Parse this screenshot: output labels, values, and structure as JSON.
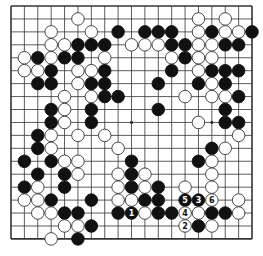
{
  "board": {
    "size": 19,
    "origin": {
      "x": 11,
      "y": 6
    },
    "spacing": {
      "x": 13.39,
      "y": 12.94
    },
    "line_color": "#333333",
    "star_points": [
      [
        3,
        3
      ],
      [
        3,
        9
      ],
      [
        3,
        15
      ],
      [
        9,
        3
      ],
      [
        9,
        9
      ],
      [
        9,
        15
      ],
      [
        15,
        3
      ],
      [
        15,
        9
      ],
      [
        15,
        15
      ]
    ],
    "colors": {
      "black": "#111111",
      "white": "#ffffff",
      "white_stroke": "#333333"
    },
    "stones": [
      {
        "c": 5,
        "r": 1,
        "color": "white"
      },
      {
        "c": 14,
        "r": 1,
        "color": "white"
      },
      {
        "c": 16,
        "r": 1,
        "color": "white"
      },
      {
        "c": 3,
        "r": 2,
        "color": "white"
      },
      {
        "c": 6,
        "r": 2,
        "color": "white"
      },
      {
        "c": 8,
        "r": 2,
        "color": "black"
      },
      {
        "c": 10,
        "r": 2,
        "color": "black"
      },
      {
        "c": 11,
        "r": 2,
        "color": "black"
      },
      {
        "c": 12,
        "r": 2,
        "color": "black"
      },
      {
        "c": 14,
        "r": 2,
        "color": "white"
      },
      {
        "c": 15,
        "r": 2,
        "color": "black"
      },
      {
        "c": 16,
        "r": 2,
        "color": "white"
      },
      {
        "c": 17,
        "r": 2,
        "color": "white"
      },
      {
        "c": 18,
        "r": 2,
        "color": "black"
      },
      {
        "c": 3,
        "r": 3,
        "color": "white"
      },
      {
        "c": 4,
        "r": 3,
        "color": "white"
      },
      {
        "c": 5,
        "r": 3,
        "color": "black"
      },
      {
        "c": 6,
        "r": 3,
        "color": "black"
      },
      {
        "c": 7,
        "r": 3,
        "color": "black"
      },
      {
        "c": 9,
        "r": 3,
        "color": "white"
      },
      {
        "c": 10,
        "r": 3,
        "color": "white"
      },
      {
        "c": 11,
        "r": 3,
        "color": "white"
      },
      {
        "c": 12,
        "r": 3,
        "color": "black"
      },
      {
        "c": 13,
        "r": 3,
        "color": "black"
      },
      {
        "c": 14,
        "r": 3,
        "color": "white"
      },
      {
        "c": 15,
        "r": 3,
        "color": "white"
      },
      {
        "c": 16,
        "r": 3,
        "color": "black"
      },
      {
        "c": 17,
        "r": 3,
        "color": "black"
      },
      {
        "c": 1,
        "r": 4,
        "color": "white"
      },
      {
        "c": 2,
        "r": 4,
        "color": "black"
      },
      {
        "c": 3,
        "r": 4,
        "color": "white"
      },
      {
        "c": 4,
        "r": 4,
        "color": "black"
      },
      {
        "c": 5,
        "r": 4,
        "color": "black"
      },
      {
        "c": 7,
        "r": 4,
        "color": "white"
      },
      {
        "c": 12,
        "r": 4,
        "color": "white"
      },
      {
        "c": 13,
        "r": 4,
        "color": "black"
      },
      {
        "c": 14,
        "r": 4,
        "color": "white"
      },
      {
        "c": 15,
        "r": 4,
        "color": "white"
      },
      {
        "c": 1,
        "r": 5,
        "color": "white"
      },
      {
        "c": 2,
        "r": 5,
        "color": "white"
      },
      {
        "c": 3,
        "r": 5,
        "color": "black"
      },
      {
        "c": 5,
        "r": 5,
        "color": "white"
      },
      {
        "c": 6,
        "r": 5,
        "color": "white"
      },
      {
        "c": 7,
        "r": 5,
        "color": "black"
      },
      {
        "c": 12,
        "r": 5,
        "color": "black"
      },
      {
        "c": 14,
        "r": 5,
        "color": "white"
      },
      {
        "c": 15,
        "r": 5,
        "color": "black"
      },
      {
        "c": 16,
        "r": 5,
        "color": "black"
      },
      {
        "c": 17,
        "r": 5,
        "color": "black"
      },
      {
        "c": 2,
        "r": 6,
        "color": "black"
      },
      {
        "c": 3,
        "r": 6,
        "color": "black"
      },
      {
        "c": 5,
        "r": 6,
        "color": "white"
      },
      {
        "c": 6,
        "r": 6,
        "color": "black"
      },
      {
        "c": 7,
        "r": 6,
        "color": "black"
      },
      {
        "c": 11,
        "r": 6,
        "color": "black"
      },
      {
        "c": 14,
        "r": 6,
        "color": "black"
      },
      {
        "c": 15,
        "r": 6,
        "color": "white"
      },
      {
        "c": 16,
        "r": 6,
        "color": "black"
      },
      {
        "c": 4,
        "r": 7,
        "color": "white"
      },
      {
        "c": 6,
        "r": 7,
        "color": "white"
      },
      {
        "c": 7,
        "r": 7,
        "color": "black"
      },
      {
        "c": 8,
        "r": 7,
        "color": "black"
      },
      {
        "c": 13,
        "r": 7,
        "color": "white"
      },
      {
        "c": 15,
        "r": 7,
        "color": "white"
      },
      {
        "c": 16,
        "r": 7,
        "color": "white"
      },
      {
        "c": 17,
        "r": 7,
        "color": "black"
      },
      {
        "c": 3,
        "r": 8,
        "color": "black"
      },
      {
        "c": 4,
        "r": 8,
        "color": "white"
      },
      {
        "c": 6,
        "r": 8,
        "color": "black"
      },
      {
        "c": 11,
        "r": 8,
        "color": "black"
      },
      {
        "c": 16,
        "r": 8,
        "color": "black"
      },
      {
        "c": 3,
        "r": 9,
        "color": "black"
      },
      {
        "c": 4,
        "r": 9,
        "color": "white"
      },
      {
        "c": 6,
        "r": 9,
        "color": "black"
      },
      {
        "c": 14,
        "r": 9,
        "color": "white"
      },
      {
        "c": 16,
        "r": 9,
        "color": "black"
      },
      {
        "c": 17,
        "r": 9,
        "color": "black"
      },
      {
        "c": 2,
        "r": 10,
        "color": "black"
      },
      {
        "c": 3,
        "r": 10,
        "color": "white"
      },
      {
        "c": 5,
        "r": 10,
        "color": "white"
      },
      {
        "c": 7,
        "r": 10,
        "color": "white"
      },
      {
        "c": 17,
        "r": 10,
        "color": "white"
      },
      {
        "c": 2,
        "r": 11,
        "color": "black"
      },
      {
        "c": 3,
        "r": 11,
        "color": "white"
      },
      {
        "c": 8,
        "r": 11,
        "color": "white"
      },
      {
        "c": 15,
        "r": 11,
        "color": "black"
      },
      {
        "c": 16,
        "r": 11,
        "color": "white"
      },
      {
        "c": 1,
        "r": 12,
        "color": "black"
      },
      {
        "c": 3,
        "r": 12,
        "color": "black"
      },
      {
        "c": 4,
        "r": 12,
        "color": "white"
      },
      {
        "c": 5,
        "r": 12,
        "color": "white"
      },
      {
        "c": 9,
        "r": 12,
        "color": "black"
      },
      {
        "c": 14,
        "r": 12,
        "color": "black"
      },
      {
        "c": 15,
        "r": 12,
        "color": "white"
      },
      {
        "c": 2,
        "r": 13,
        "color": "black"
      },
      {
        "c": 4,
        "r": 13,
        "color": "black"
      },
      {
        "c": 5,
        "r": 13,
        "color": "white"
      },
      {
        "c": 8,
        "r": 13,
        "color": "white"
      },
      {
        "c": 9,
        "r": 13,
        "color": "black"
      },
      {
        "c": 10,
        "r": 13,
        "color": "white"
      },
      {
        "c": 15,
        "r": 13,
        "color": "white"
      },
      {
        "c": 1,
        "r": 14,
        "color": "black"
      },
      {
        "c": 2,
        "r": 14,
        "color": "white"
      },
      {
        "c": 4,
        "r": 14,
        "color": "black"
      },
      {
        "c": 8,
        "r": 14,
        "color": "white"
      },
      {
        "c": 9,
        "r": 14,
        "color": "black"
      },
      {
        "c": 10,
        "r": 14,
        "color": "white"
      },
      {
        "c": 11,
        "r": 14,
        "color": "black"
      },
      {
        "c": 13,
        "r": 14,
        "color": "white"
      },
      {
        "c": 15,
        "r": 14,
        "color": "white"
      },
      {
        "c": 1,
        "r": 15,
        "color": "white"
      },
      {
        "c": 2,
        "r": 15,
        "color": "white"
      },
      {
        "c": 3,
        "r": 15,
        "color": "black"
      },
      {
        "c": 6,
        "r": 15,
        "color": "black"
      },
      {
        "c": 8,
        "r": 15,
        "color": "white"
      },
      {
        "c": 9,
        "r": 15,
        "color": "white"
      },
      {
        "c": 10,
        "r": 15,
        "color": "black"
      },
      {
        "c": 11,
        "r": 15,
        "color": "black"
      },
      {
        "c": 13,
        "r": 15,
        "color": "black",
        "label": "5"
      },
      {
        "c": 14,
        "r": 15,
        "color": "black",
        "label": "3"
      },
      {
        "c": 15,
        "r": 15,
        "color": "white",
        "label": "6"
      },
      {
        "c": 17,
        "r": 15,
        "color": "white"
      },
      {
        "c": 2,
        "r": 16,
        "color": "white"
      },
      {
        "c": 3,
        "r": 16,
        "color": "white"
      },
      {
        "c": 4,
        "r": 16,
        "color": "black"
      },
      {
        "c": 5,
        "r": 16,
        "color": "black"
      },
      {
        "c": 8,
        "r": 16,
        "color": "black"
      },
      {
        "c": 9,
        "r": 16,
        "color": "black",
        "label": "1"
      },
      {
        "c": 10,
        "r": 16,
        "color": "white"
      },
      {
        "c": 11,
        "r": 16,
        "color": "black"
      },
      {
        "c": 12,
        "r": 16,
        "color": "black"
      },
      {
        "c": 13,
        "r": 16,
        "color": "white",
        "label": "4"
      },
      {
        "c": 14,
        "r": 16,
        "color": "white"
      },
      {
        "c": 15,
        "r": 16,
        "color": "black"
      },
      {
        "c": 16,
        "r": 16,
        "color": "black"
      },
      {
        "c": 17,
        "r": 16,
        "color": "white"
      },
      {
        "c": 4,
        "r": 17,
        "color": "white"
      },
      {
        "c": 5,
        "r": 17,
        "color": "white"
      },
      {
        "c": 6,
        "r": 17,
        "color": "black"
      },
      {
        "c": 13,
        "r": 17,
        "color": "white",
        "label": "2"
      },
      {
        "c": 14,
        "r": 17,
        "color": "black"
      },
      {
        "c": 15,
        "r": 17,
        "color": "white"
      },
      {
        "c": 3,
        "r": 18,
        "color": "white"
      },
      {
        "c": 5,
        "r": 18,
        "color": "black"
      }
    ]
  }
}
